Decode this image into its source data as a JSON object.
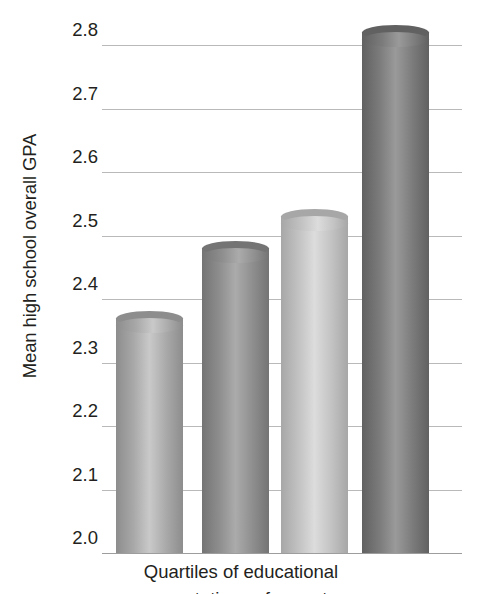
{
  "chart_data": {
    "type": "bar",
    "title": "",
    "subtitle": "",
    "xlabel": "Quartiles of educational",
    "xlabel_line2": "expectations of parents",
    "ylabel": "Mean high school overall GPA",
    "categories": [
      "Quartile 1",
      "Quartile 2",
      "Quartile 3",
      "Quartile 4"
    ],
    "values": [
      2.37,
      2.48,
      2.53,
      2.82
    ],
    "ylim": [
      2.0,
      2.8
    ],
    "ytick_labels": [
      "2.8",
      "2.7",
      "2.6",
      "2.5",
      "2.4",
      "2.3",
      "2.2",
      "2.1",
      "2.0"
    ],
    "ytick_values": [
      2.8,
      2.7,
      2.6,
      2.5,
      2.4,
      2.3,
      2.2,
      2.1,
      2.0
    ],
    "grid": true,
    "legend": "none",
    "bar_style": "3d-cylinder",
    "bar_colors": [
      "#a8a8a8",
      "#8e8e8e",
      "#c2c2c2",
      "#7b7b7b"
    ],
    "bar_top_colors": [
      "#c9c9c9",
      "#ababab",
      "#dcdcdc",
      "#9a9a9a"
    ],
    "bar_shade_colors": [
      "#8d8d8d",
      "#747474",
      "#a7a7a7",
      "#616161"
    ],
    "grid_color": "#b9b9b9",
    "axis_color": "#9d9d9d",
    "text_color": "#231f20",
    "background": "#ffffff"
  },
  "axis": {
    "y_title": "Mean high school overall GPA",
    "x_title_line1": "Quartiles of educational",
    "x_title_line2": "expectations of parents",
    "ticks": [
      {
        "label": "2.8",
        "value": 2.8
      },
      {
        "label": "2.7",
        "value": 2.7
      },
      {
        "label": "2.6",
        "value": 2.6
      },
      {
        "label": "2.5",
        "value": 2.5
      },
      {
        "label": "2.4",
        "value": 2.4
      },
      {
        "label": "2.3",
        "value": 2.3
      },
      {
        "label": "2.2",
        "value": 2.2
      },
      {
        "label": "2.1",
        "value": 2.1
      },
      {
        "label": "2.0",
        "value": 2.0
      }
    ]
  }
}
